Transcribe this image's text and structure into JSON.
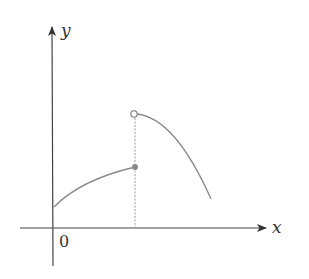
{
  "figure": {
    "x_axis_label": "x",
    "y_axis_label": "y",
    "origin_label": "0",
    "colors": {
      "axis": "#444444",
      "curve": "#8a8a8a",
      "dashed": "#9a9a9a",
      "point": "#8a8a8a"
    }
  }
}
